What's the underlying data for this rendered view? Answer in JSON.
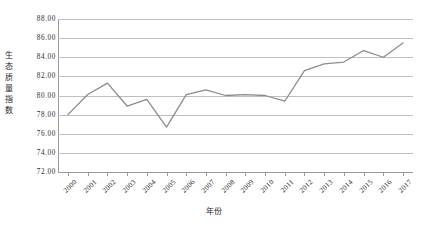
{
  "chart_data": {
    "type": "line",
    "title": "",
    "xlabel": "年份",
    "ylabel": "生态质量指数",
    "categories": [
      "2000",
      "2001",
      "2002",
      "2003",
      "2004",
      "2005",
      "2006",
      "2007",
      "2008",
      "2009",
      "2010",
      "2011",
      "2012",
      "2013",
      "2014",
      "2015",
      "2016",
      "2017"
    ],
    "values": [
      78.0,
      80.1,
      81.3,
      78.9,
      79.6,
      76.7,
      80.1,
      80.6,
      80.0,
      80.1,
      80.0,
      79.4,
      82.6,
      83.3,
      83.5,
      84.7,
      84.0,
      85.5
    ],
    "series": [
      {
        "name": "生态质量指数",
        "values": [
          78.0,
          80.1,
          81.3,
          78.9,
          79.6,
          76.7,
          80.1,
          80.6,
          80.0,
          80.1,
          80.0,
          79.4,
          82.6,
          83.3,
          83.5,
          84.7,
          84.0,
          85.5
        ]
      }
    ],
    "ylim": [
      72.0,
      88.0
    ],
    "ytick_labels": [
      "88.00",
      "86.00",
      "84.00",
      "82.00",
      "80.00",
      "78.00",
      "76.00",
      "74.00",
      "72.00"
    ],
    "ytick_values": [
      88.0,
      86.0,
      84.0,
      82.0,
      80.0,
      78.0,
      76.0,
      74.0,
      72.0
    ],
    "ytick_step": 2.0,
    "grid": true,
    "grid_axis": "y",
    "legend": "none",
    "line_color": "#8c8c8c",
    "grid_color": "#bfbfbf",
    "axis_color": "#9a9a9a",
    "text_color": "#2b2b2b",
    "background_color": "#ffffff",
    "xtick_rotation": -45,
    "markers": false
  }
}
